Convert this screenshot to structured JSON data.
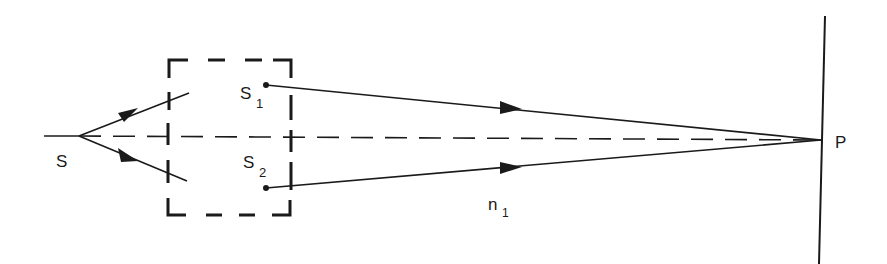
{
  "diagram": {
    "colors": {
      "ink": "#1a1a1a",
      "background": "#ffffff"
    },
    "labels": {
      "source": "S",
      "source1_main": "S",
      "source1_sub": "1",
      "source2_main": "S",
      "source2_sub": "2",
      "medium_main": "n",
      "medium_sub": "1",
      "point": "P"
    },
    "elements": [
      {
        "name": "primary-source",
        "label": "S"
      },
      {
        "name": "secondary-source-1",
        "label": "S1"
      },
      {
        "name": "secondary-source-2",
        "label": "S2"
      },
      {
        "name": "dashed-box",
        "label": ""
      },
      {
        "name": "optical-axis",
        "label": "dashed"
      },
      {
        "name": "screen",
        "label": ""
      },
      {
        "name": "observation-point",
        "label": "P"
      },
      {
        "name": "medium",
        "label": "n1"
      }
    ]
  }
}
